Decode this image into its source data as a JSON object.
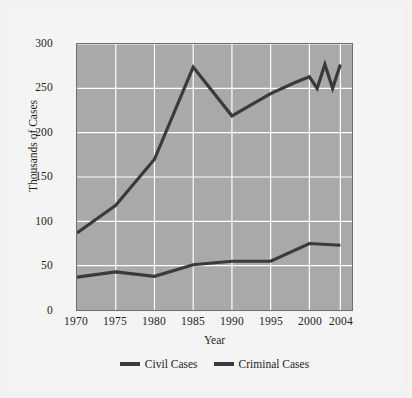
{
  "chart_data": {
    "type": "line",
    "title": "",
    "xlabel": "Year",
    "ylabel": "Thousands of Cases",
    "x": [
      1970,
      1975,
      1980,
      1985,
      1990,
      1995,
      2000,
      2004
    ],
    "xlim": [
      1970,
      2005.5
    ],
    "ylim": [
      0,
      300
    ],
    "ytick_labels": [
      "0",
      "50",
      "100",
      "150",
      "200",
      "250",
      "300"
    ],
    "yticks": [
      0,
      50,
      100,
      150,
      200,
      250,
      300
    ],
    "xtick_labels": [
      "1970",
      "1975",
      "1980",
      "1985",
      "1990",
      "1995",
      "2000",
      "2004"
    ],
    "xticks": [
      1970,
      1975,
      1980,
      1985,
      1990,
      1995,
      2000,
      2004
    ],
    "grid": true,
    "grid_color": "#ffffff",
    "plot_background": "#a9a9a9",
    "line_color": "#3a3a3a",
    "legend_position": "bottom-center",
    "series": [
      {
        "name": "Civil Cases",
        "color": "#3a3a3a",
        "points": [
          {
            "x": 1970,
            "y": 87
          },
          {
            "x": 1975,
            "y": 118
          },
          {
            "x": 1980,
            "y": 170
          },
          {
            "x": 1985,
            "y": 274
          },
          {
            "x": 1990,
            "y": 219
          },
          {
            "x": 1995,
            "y": 244
          },
          {
            "x": 1998,
            "y": 256
          },
          {
            "x": 2000,
            "y": 263
          },
          {
            "x": 2001,
            "y": 250
          },
          {
            "x": 2002,
            "y": 277
          },
          {
            "x": 2003,
            "y": 250
          },
          {
            "x": 2004,
            "y": 277
          }
        ]
      },
      {
        "name": "Criminal Cases",
        "color": "#3a3a3a",
        "points": [
          {
            "x": 1970,
            "y": 37
          },
          {
            "x": 1975,
            "y": 43
          },
          {
            "x": 1980,
            "y": 38
          },
          {
            "x": 1985,
            "y": 51
          },
          {
            "x": 1990,
            "y": 55
          },
          {
            "x": 1995,
            "y": 55
          },
          {
            "x": 2000,
            "y": 75
          },
          {
            "x": 2004,
            "y": 73
          }
        ]
      }
    ]
  },
  "axes": {
    "y_title": "Thousands of Cases",
    "x_title": "Year",
    "y_tick_0": "0",
    "y_tick_1": "50",
    "y_tick_2": "100",
    "y_tick_3": "150",
    "y_tick_4": "200",
    "y_tick_5": "250",
    "y_tick_6": "300",
    "x_tick_0": "1970",
    "x_tick_1": "1975",
    "x_tick_2": "1980",
    "x_tick_3": "1985",
    "x_tick_4": "1990",
    "x_tick_5": "1995",
    "x_tick_6": "2000",
    "x_tick_7": "2004"
  },
  "legend": {
    "items": [
      {
        "label": "Civil Cases"
      },
      {
        "label": "Criminal Cases"
      }
    ]
  }
}
